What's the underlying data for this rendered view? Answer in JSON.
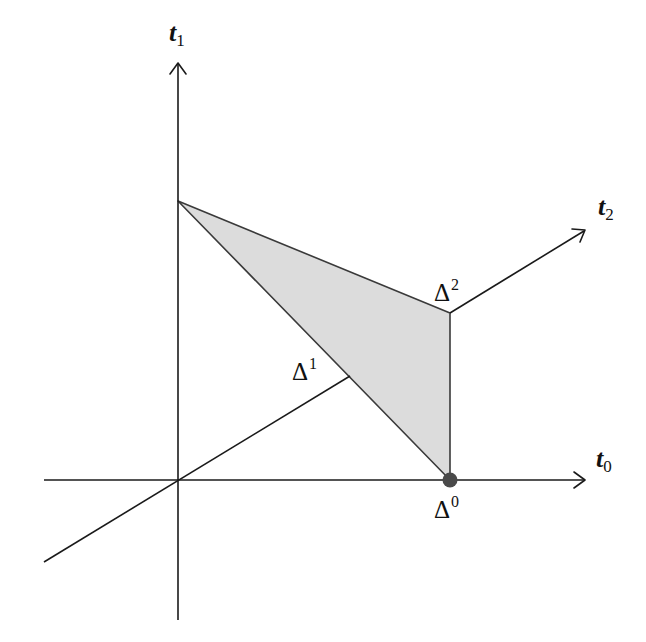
{
  "diagram": {
    "type": "geometric simplex in 3D coordinate axes",
    "colors": {
      "axis": "#1a1a1a",
      "simplex_fill": "#dcdcdc",
      "simplex_stroke": "#3a3a3a",
      "vertex_dot": "#4a4a4a",
      "background": "#ffffff"
    },
    "axes": [
      {
        "id": "t0",
        "var": "t",
        "sub": "0",
        "direction": "right"
      },
      {
        "id": "t1",
        "var": "t",
        "sub": "1",
        "direction": "up"
      },
      {
        "id": "t2",
        "var": "t",
        "sub": "2",
        "direction": "diagonal up-right"
      }
    ],
    "vertices": [
      {
        "id": "delta0",
        "symbol": "Δ",
        "sup": "0",
        "on_axis": "t0",
        "highlighted": true
      },
      {
        "id": "delta1",
        "symbol": "Δ",
        "sup": "1",
        "on_axis": "t1",
        "highlighted": false
      },
      {
        "id": "delta2",
        "symbol": "Δ",
        "sup": "2",
        "on_axis": "t2",
        "highlighted": false
      }
    ],
    "shape": "shaded triangle (2-simplex) spanned by Δ0, Δ1, Δ2"
  }
}
